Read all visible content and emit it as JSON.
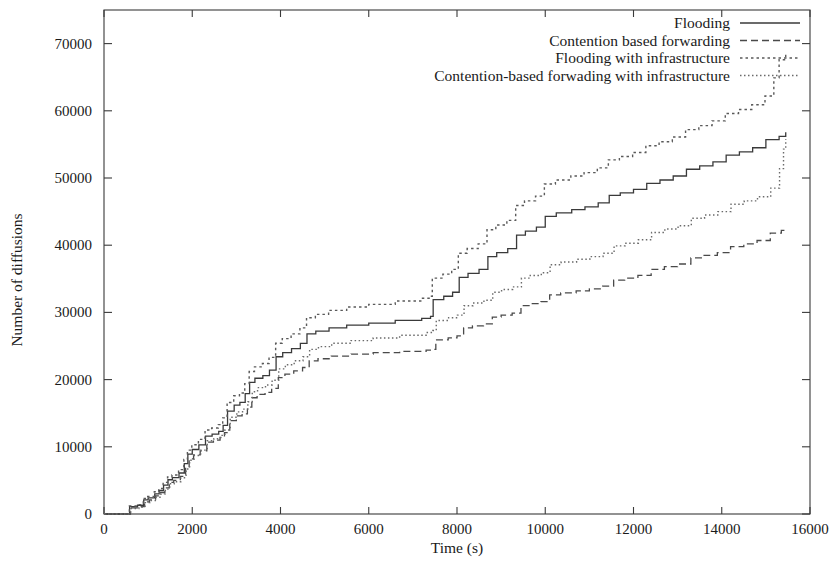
{
  "chart_data": {
    "type": "line",
    "title": "",
    "xlabel": "Time (s)",
    "ylabel": "Number of diffusions",
    "xlim": [
      0,
      16000
    ],
    "ylim": [
      0,
      75000
    ],
    "xticks": [
      0,
      2000,
      4000,
      6000,
      8000,
      10000,
      12000,
      14000,
      16000
    ],
    "xtick_labels": [
      "0",
      "2000",
      "4000",
      "6000",
      "8000",
      "10000",
      "12000",
      "14000",
      "16000"
    ],
    "yticks": [
      0,
      10000,
      20000,
      30000,
      40000,
      50000,
      60000,
      70000
    ],
    "ytick_labels": [
      "0",
      "10000",
      "20000",
      "30000",
      "40000",
      "50000",
      "60000",
      "70000"
    ],
    "grid": false,
    "legend_position": "top-right",
    "legend_entries": [
      {
        "label": "Flooding",
        "style": "solid"
      },
      {
        "label": "Contention based forwarding",
        "style": "dashed"
      },
      {
        "label": "Flooding with infrastructure",
        "style": "dotted"
      },
      {
        "label": "Contention-based forwading with infrastructure",
        "style": "fine-dotted"
      }
    ],
    "series": [
      {
        "name": "Flooding",
        "style": "solid",
        "dasharray": "none",
        "color": "#3a3a3a",
        "width": 1.3,
        "points": [
          [
            0,
            0
          ],
          [
            560,
            0
          ],
          [
            580,
            1100
          ],
          [
            760,
            1300
          ],
          [
            900,
            2100
          ],
          [
            1000,
            2400
          ],
          [
            1150,
            3000
          ],
          [
            1250,
            3500
          ],
          [
            1350,
            4300
          ],
          [
            1450,
            5100
          ],
          [
            1550,
            5400
          ],
          [
            1700,
            6100
          ],
          [
            1820,
            7500
          ],
          [
            1900,
            8900
          ],
          [
            2000,
            9600
          ],
          [
            2150,
            10300
          ],
          [
            2300,
            11600
          ],
          [
            2450,
            11900
          ],
          [
            2600,
            12300
          ],
          [
            2700,
            13200
          ],
          [
            2800,
            15300
          ],
          [
            2950,
            16200
          ],
          [
            3080,
            16600
          ],
          [
            3200,
            17900
          ],
          [
            3300,
            19600
          ],
          [
            3420,
            20200
          ],
          [
            3600,
            20600
          ],
          [
            3750,
            21400
          ],
          [
            3900,
            23400
          ],
          [
            4050,
            24000
          ],
          [
            4250,
            24600
          ],
          [
            4450,
            25400
          ],
          [
            4600,
            26800
          ],
          [
            4800,
            27200
          ],
          [
            5100,
            27700
          ],
          [
            5500,
            28100
          ],
          [
            6000,
            28400
          ],
          [
            6600,
            28800
          ],
          [
            7200,
            29100
          ],
          [
            7400,
            29400
          ],
          [
            7460,
            31900
          ],
          [
            7700,
            32400
          ],
          [
            7900,
            33000
          ],
          [
            8050,
            35200
          ],
          [
            8250,
            35800
          ],
          [
            8500,
            36400
          ],
          [
            8700,
            38300
          ],
          [
            8900,
            38900
          ],
          [
            9150,
            39500
          ],
          [
            9350,
            41500
          ],
          [
            9550,
            42100
          ],
          [
            9800,
            42700
          ],
          [
            10000,
            44300
          ],
          [
            10250,
            44800
          ],
          [
            10600,
            45300
          ],
          [
            10900,
            45700
          ],
          [
            11200,
            46300
          ],
          [
            11450,
            47400
          ],
          [
            11700,
            47800
          ],
          [
            12000,
            48300
          ],
          [
            12300,
            49200
          ],
          [
            12600,
            49700
          ],
          [
            12900,
            50300
          ],
          [
            13200,
            51300
          ],
          [
            13500,
            51800
          ],
          [
            13800,
            52400
          ],
          [
            14100,
            53400
          ],
          [
            14400,
            53900
          ],
          [
            14700,
            54500
          ],
          [
            15000,
            55700
          ],
          [
            15300,
            56200
          ],
          [
            15450,
            56800
          ]
        ]
      },
      {
        "name": "Contention based forwarding",
        "style": "dashed",
        "dasharray": "7,4",
        "color": "#4a4a4a",
        "width": 1.3,
        "points": [
          [
            0,
            0
          ],
          [
            570,
            0
          ],
          [
            600,
            900
          ],
          [
            780,
            1100
          ],
          [
            920,
            1800
          ],
          [
            1030,
            2100
          ],
          [
            1170,
            2700
          ],
          [
            1280,
            3200
          ],
          [
            1380,
            3900
          ],
          [
            1480,
            4700
          ],
          [
            1580,
            5000
          ],
          [
            1730,
            5600
          ],
          [
            1850,
            6900
          ],
          [
            1930,
            8200
          ],
          [
            2030,
            8800
          ],
          [
            2180,
            9400
          ],
          [
            2330,
            10700
          ],
          [
            2480,
            11000
          ],
          [
            2630,
            11400
          ],
          [
            2730,
            12100
          ],
          [
            2850,
            13900
          ],
          [
            3000,
            14600
          ],
          [
            3130,
            14900
          ],
          [
            3250,
            15900
          ],
          [
            3350,
            17300
          ],
          [
            3470,
            17800
          ],
          [
            3650,
            18100
          ],
          [
            3800,
            18700
          ],
          [
            3950,
            20300
          ],
          [
            4100,
            20800
          ],
          [
            4300,
            21300
          ],
          [
            4500,
            21800
          ],
          [
            4650,
            22800
          ],
          [
            4850,
            23100
          ],
          [
            5150,
            23500
          ],
          [
            5600,
            23800
          ],
          [
            6100,
            24000
          ],
          [
            6700,
            24200
          ],
          [
            7300,
            24400
          ],
          [
            7450,
            24500
          ],
          [
            7520,
            25900
          ],
          [
            7800,
            26200
          ],
          [
            8000,
            26500
          ],
          [
            8150,
            27700
          ],
          [
            8350,
            28000
          ],
          [
            8600,
            28300
          ],
          [
            8800,
            29300
          ],
          [
            9000,
            29600
          ],
          [
            9250,
            29900
          ],
          [
            9450,
            31000
          ],
          [
            9650,
            31300
          ],
          [
            9900,
            31600
          ],
          [
            10100,
            32600
          ],
          [
            10350,
            32900
          ],
          [
            10700,
            33200
          ],
          [
            11000,
            33500
          ],
          [
            11300,
            33900
          ],
          [
            11550,
            34800
          ],
          [
            11800,
            35100
          ],
          [
            12100,
            35500
          ],
          [
            12400,
            36400
          ],
          [
            12700,
            36800
          ],
          [
            13000,
            37200
          ],
          [
            13300,
            38100
          ],
          [
            13600,
            38500
          ],
          [
            13900,
            38900
          ],
          [
            14200,
            39800
          ],
          [
            14500,
            40200
          ],
          [
            14800,
            40700
          ],
          [
            15100,
            41800
          ],
          [
            15350,
            42200
          ],
          [
            15450,
            42500
          ]
        ]
      },
      {
        "name": "Flooding with infrastructure",
        "style": "dotted",
        "dasharray": "2.5,3",
        "color": "#5a5a5a",
        "width": 1.4,
        "points": [
          [
            0,
            0
          ],
          [
            555,
            0
          ],
          [
            575,
            1200
          ],
          [
            750,
            1400
          ],
          [
            890,
            2300
          ],
          [
            990,
            2600
          ],
          [
            1140,
            3300
          ],
          [
            1240,
            3800
          ],
          [
            1340,
            4700
          ],
          [
            1440,
            5500
          ],
          [
            1540,
            5800
          ],
          [
            1690,
            6600
          ],
          [
            1810,
            8100
          ],
          [
            1890,
            9500
          ],
          [
            1990,
            10300
          ],
          [
            2140,
            11100
          ],
          [
            2290,
            12500
          ],
          [
            2440,
            12800
          ],
          [
            2590,
            13300
          ],
          [
            2690,
            14300
          ],
          [
            2790,
            16600
          ],
          [
            2940,
            17600
          ],
          [
            3070,
            18000
          ],
          [
            3190,
            19400
          ],
          [
            3290,
            21200
          ],
          [
            3410,
            21900
          ],
          [
            3590,
            22400
          ],
          [
            3740,
            23300
          ],
          [
            3890,
            25400
          ],
          [
            4040,
            26100
          ],
          [
            4240,
            26800
          ],
          [
            4440,
            27700
          ],
          [
            4590,
            29200
          ],
          [
            4790,
            29700
          ],
          [
            5090,
            30300
          ],
          [
            5500,
            30800
          ],
          [
            6000,
            31200
          ],
          [
            6600,
            31700
          ],
          [
            7200,
            32100
          ],
          [
            7400,
            32400
          ],
          [
            7440,
            35100
          ],
          [
            7680,
            35700
          ],
          [
            7880,
            36400
          ],
          [
            8030,
            38800
          ],
          [
            8230,
            39500
          ],
          [
            8480,
            40200
          ],
          [
            8680,
            42300
          ],
          [
            8880,
            43000
          ],
          [
            9130,
            43700
          ],
          [
            9330,
            45900
          ],
          [
            9530,
            46600
          ],
          [
            9780,
            47300
          ],
          [
            9980,
            49100
          ],
          [
            10230,
            49700
          ],
          [
            10580,
            50300
          ],
          [
            10880,
            50800
          ],
          [
            11180,
            51500
          ],
          [
            11430,
            52700
          ],
          [
            11680,
            53200
          ],
          [
            11980,
            53800
          ],
          [
            12280,
            54800
          ],
          [
            12580,
            55400
          ],
          [
            12880,
            56100
          ],
          [
            13180,
            57200
          ],
          [
            13480,
            57800
          ],
          [
            13780,
            58500
          ],
          [
            14080,
            59600
          ],
          [
            14380,
            60200
          ],
          [
            14680,
            60900
          ],
          [
            14980,
            62200
          ],
          [
            15180,
            64900
          ],
          [
            15300,
            67600
          ],
          [
            15450,
            68500
          ]
        ]
      },
      {
        "name": "Contention-based forwading with infrastructure",
        "style": "fine-dotted",
        "dasharray": "1.5,2.5",
        "color": "#6a6a6a",
        "width": 1.4,
        "points": [
          [
            0,
            0
          ],
          [
            575,
            0
          ],
          [
            605,
            800
          ],
          [
            790,
            1000
          ],
          [
            930,
            1700
          ],
          [
            1040,
            2000
          ],
          [
            1180,
            2500
          ],
          [
            1290,
            3000
          ],
          [
            1390,
            3700
          ],
          [
            1490,
            4500
          ],
          [
            1590,
            4800
          ],
          [
            1740,
            5400
          ],
          [
            1860,
            6700
          ],
          [
            1940,
            8000
          ],
          [
            2040,
            8700
          ],
          [
            2190,
            9500
          ],
          [
            2340,
            10900
          ],
          [
            2490,
            11200
          ],
          [
            2640,
            11700
          ],
          [
            2740,
            12500
          ],
          [
            2860,
            14400
          ],
          [
            3010,
            15200
          ],
          [
            3140,
            15600
          ],
          [
            3260,
            16700
          ],
          [
            3360,
            18200
          ],
          [
            3480,
            18800
          ],
          [
            3660,
            19200
          ],
          [
            3810,
            19900
          ],
          [
            3960,
            21600
          ],
          [
            4110,
            22200
          ],
          [
            4310,
            22800
          ],
          [
            4510,
            23400
          ],
          [
            4660,
            24500
          ],
          [
            4860,
            24900
          ],
          [
            5160,
            25400
          ],
          [
            5600,
            25800
          ],
          [
            6100,
            26200
          ],
          [
            6700,
            26600
          ],
          [
            7300,
            27000
          ],
          [
            7450,
            27300
          ],
          [
            7530,
            28800
          ],
          [
            7810,
            29200
          ],
          [
            8010,
            29600
          ],
          [
            8160,
            31000
          ],
          [
            8360,
            31400
          ],
          [
            8610,
            31800
          ],
          [
            8810,
            33000
          ],
          [
            9010,
            33400
          ],
          [
            9260,
            33800
          ],
          [
            9460,
            35100
          ],
          [
            9660,
            35500
          ],
          [
            9910,
            35900
          ],
          [
            10110,
            37100
          ],
          [
            10360,
            37500
          ],
          [
            10710,
            37900
          ],
          [
            11010,
            38300
          ],
          [
            11310,
            38800
          ],
          [
            11560,
            39900
          ],
          [
            11810,
            40300
          ],
          [
            12110,
            40800
          ],
          [
            12410,
            41900
          ],
          [
            12710,
            42400
          ],
          [
            13010,
            42900
          ],
          [
            13310,
            44000
          ],
          [
            13610,
            44500
          ],
          [
            13910,
            45000
          ],
          [
            14210,
            46100
          ],
          [
            14510,
            46600
          ],
          [
            14810,
            47200
          ],
          [
            15110,
            48500
          ],
          [
            15310,
            51400
          ],
          [
            15400,
            54300
          ],
          [
            15450,
            55800
          ]
        ]
      }
    ]
  }
}
